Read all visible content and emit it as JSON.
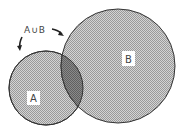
{
  "diagram": {
    "type": "venn",
    "sets": [
      {
        "id": "A",
        "label": "A",
        "cx": 46,
        "cy": 88,
        "r": 37
      },
      {
        "id": "B",
        "label": "B",
        "cx": 118,
        "cy": 66,
        "r": 57
      }
    ],
    "union_label": "A∪B",
    "colors": {
      "fill": "#bdbdbd",
      "intersection": "#7e7e7e",
      "stroke": "#333333",
      "label_box": "#ffffff"
    }
  }
}
